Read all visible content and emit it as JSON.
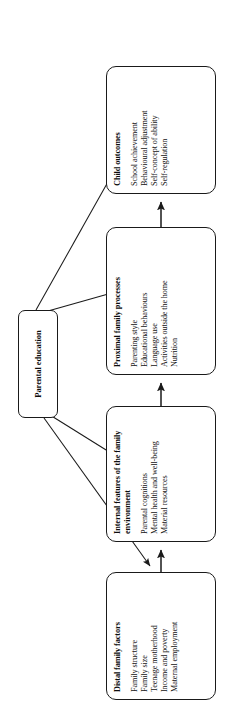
{
  "figure": {
    "orientation": "rotated-90-ccw",
    "background": "#ffffff",
    "line_color": "#1a1a1a"
  },
  "nodes": {
    "parental_education": {
      "title": "Parental education",
      "items": []
    },
    "distal_family_factors": {
      "title": "Distal family factors",
      "items": [
        "Family structure",
        "Family size",
        "Teenage motherhood",
        "Income and poverty",
        "Maternal employment"
      ]
    },
    "internal_features": {
      "title": "Internal features of the family environment",
      "items": [
        "Parental cognitions",
        "Mental health and well-being",
        "Material resources"
      ]
    },
    "proximal_family_processes": {
      "title": "Proximal family processes",
      "items": [
        "Parenting style",
        "Educational behaviours",
        "Language use",
        "Activities outside the home",
        "Nutrition"
      ]
    },
    "child_outcomes": {
      "title": "Child outcomes",
      "items": [
        "School achievement",
        "Behavioural adjustment",
        "Self-concept of ability",
        "Self-regulation"
      ]
    }
  },
  "edges": [
    {
      "from": "parental_education",
      "to": "distal_family_factors",
      "style": "thin-arrow"
    },
    {
      "from": "parental_education",
      "to": "internal_features",
      "style": "thin-arrow"
    },
    {
      "from": "parental_education",
      "to": "proximal_family_processes",
      "style": "thin-arrow"
    },
    {
      "from": "parental_education",
      "to": "child_outcomes",
      "style": "thin-arrow"
    },
    {
      "from": "distal_family_factors",
      "to": "internal_features",
      "style": "chain-arrow"
    },
    {
      "from": "internal_features",
      "to": "proximal_family_processes",
      "style": "chain-arrow"
    },
    {
      "from": "proximal_family_processes",
      "to": "child_outcomes",
      "style": "chain-arrow"
    }
  ]
}
